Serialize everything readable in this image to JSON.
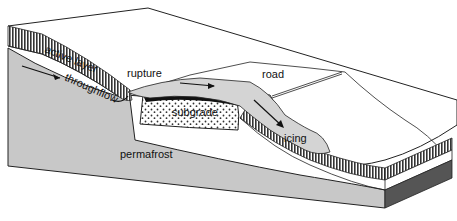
{
  "diagram": {
    "labels": {
      "active_layer": "active layer",
      "throughflow": "throughflow",
      "rupture": "rupture",
      "road": "road",
      "subgrade": "subgrade",
      "icing": "icing",
      "permafrost": "permafrost"
    },
    "colors": {
      "background": "#ffffff",
      "permafrost_fill": "#c8c8c8",
      "icing_fill": "#d4d4d4",
      "active_layer_stripes": "#333333",
      "outline": "#222222",
      "subgrade_fill": "#ffffff",
      "subgrade_dots": "#333333",
      "dark_side": "#555555"
    }
  }
}
